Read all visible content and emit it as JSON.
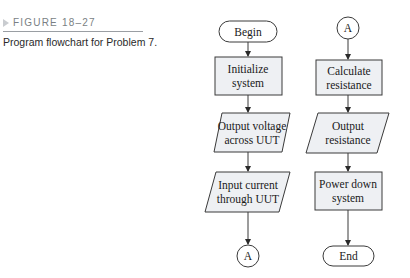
{
  "caption": {
    "figure_label": "FIGURE 18–27",
    "text": "Program flowchart for Problem 7."
  },
  "colors": {
    "box_fill": "#eef0f3",
    "stroke": "#3a3a3a",
    "label_gray": "#7a7f84"
  },
  "flowchart": {
    "left_column": [
      {
        "type": "terminal",
        "lines": [
          "Begin"
        ]
      },
      {
        "type": "process",
        "lines": [
          "Initialize",
          "system"
        ]
      },
      {
        "type": "io",
        "lines": [
          "Output voltage",
          "across UUT"
        ]
      },
      {
        "type": "io",
        "lines": [
          "Input current",
          "through UUT"
        ]
      },
      {
        "type": "connector",
        "lines": [
          "A"
        ]
      }
    ],
    "right_column": [
      {
        "type": "connector",
        "lines": [
          "A"
        ]
      },
      {
        "type": "process",
        "lines": [
          "Calculate",
          "resistance"
        ]
      },
      {
        "type": "io",
        "lines": [
          "Output",
          "resistance"
        ]
      },
      {
        "type": "process",
        "lines": [
          "Power down",
          "system"
        ]
      },
      {
        "type": "terminal",
        "lines": [
          "End"
        ]
      }
    ]
  }
}
